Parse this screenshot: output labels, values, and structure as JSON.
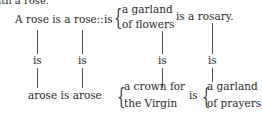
{
  "top_fragment": "ith a rose.",
  "row1": {
    "lead": "A rose is a rose::is",
    "brace_top": "a garland",
    "brace_bottom": "of flowers",
    "tail": "is a rosary."
  },
  "connectors": [
    "is",
    "is",
    "is",
    "is"
  ],
  "row2": {
    "lead": "arose is arose",
    "brace1_top": "a crown for",
    "brace1_bottom": "the Virgin",
    "mid": "is",
    "brace2_top": "a garland",
    "brace2_bottom": "of prayers"
  },
  "glyphs": {
    "brace": "{"
  }
}
